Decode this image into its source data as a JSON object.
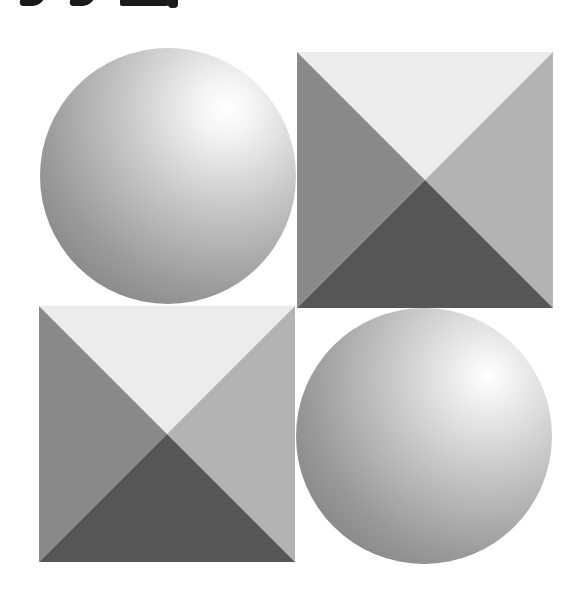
{
  "figure": {
    "header_text_cropped": true,
    "tiles": [
      {
        "position": "top-left",
        "shape": "sphere",
        "cx": 168,
        "cy": 176,
        "r": 128,
        "highlight": [
          226,
          108
        ]
      },
      {
        "position": "top-right",
        "shape": "pyramid-square",
        "x": 297,
        "y": 52,
        "size": 256
      },
      {
        "position": "bottom-left",
        "shape": "pyramid-square",
        "x": 39,
        "y": 306,
        "size": 256
      },
      {
        "position": "bottom-right",
        "shape": "sphere",
        "cx": 424,
        "cy": 436,
        "r": 128,
        "highlight": [
          488,
          376
        ]
      }
    ],
    "colors": {
      "background": "#ffffff",
      "facet_top": "#ececec",
      "facet_left": "#8a8a8a",
      "facet_right": "#b3b3b3",
      "facet_bottom": "#565656",
      "sphere_highlight": "#ffffff",
      "sphere_mid": "#c4c4c4",
      "sphere_shadow": "#8a8a8a"
    }
  }
}
